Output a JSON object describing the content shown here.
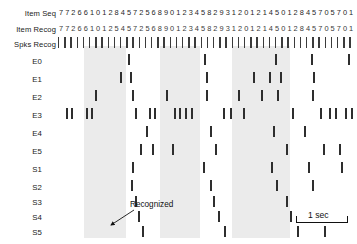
{
  "figure": {
    "title": "",
    "width": 357,
    "height": 244,
    "background_color": "#ffffff",
    "band_color": "#e8e8e8",
    "spike_color": "#2e2e2e"
  },
  "labels": {
    "item_seq": "Item Seq",
    "item_recog": "Item Recog",
    "spks_recog": "Spks Recog",
    "e0": "E0",
    "e1": "E1",
    "e2": "E2",
    "e3": "E3",
    "e4": "E4",
    "e5": "E5",
    "s1": "S1",
    "s2": "S2",
    "s3": "S3",
    "s4": "S4",
    "s5": "S5"
  },
  "annotation": {
    "recognized": "Recognized"
  },
  "scalebar": {
    "label": "1 sec"
  },
  "chart_data": {
    "type": "raster",
    "title": "",
    "xlabel": "",
    "ylabel": "",
    "xlim": [
      0,
      296
    ],
    "grid": false,
    "legend": null,
    "sequences": {
      "item_seq": "77266101284572568901234582931201214501284570 5701",
      "item_seq_digits": [
        "7",
        "7",
        "2",
        "6",
        "6",
        "1",
        "0",
        "1",
        "2",
        "8",
        "4",
        "5",
        "7",
        "2",
        "5",
        "6",
        "8",
        "9",
        "0",
        "1",
        "2",
        "3",
        "4",
        "5",
        "8",
        "2",
        "9",
        "3",
        "1",
        "2",
        "0",
        "1",
        "2",
        "1",
        "4",
        "5",
        "0",
        "1",
        "2",
        "8",
        "4",
        "5",
        "7",
        "0",
        "5",
        "7",
        "0",
        "1"
      ],
      "item_recog_digits": [
        "7",
        "7",
        "2",
        "6",
        "6",
        "1",
        "0",
        "1",
        "2",
        "5",
        "4",
        "5",
        "7",
        "2",
        "5",
        "6",
        "8",
        "9",
        "0",
        "1",
        "2",
        "3",
        "4",
        "5",
        "8",
        "2",
        "9",
        "3",
        "1",
        "2",
        "0",
        "1",
        "2",
        "1",
        "4",
        "5",
        "0",
        "1",
        "2",
        "8",
        "4",
        "5",
        "7",
        "0",
        "5",
        "7",
        "0",
        "1"
      ]
    },
    "bands": [
      {
        "x": 84,
        "width": 42
      },
      {
        "x": 160,
        "width": 40
      },
      {
        "x": 232,
        "width": 58
      }
    ],
    "rows": [
      {
        "name": "Spks Recog",
        "type": "ticks",
        "times": [
          0,
          6.2,
          12.4,
          18.6,
          24.8,
          31,
          37.2,
          43.4,
          49.6,
          55.8,
          62,
          68.2,
          74.4,
          80.6,
          86.8,
          93,
          99.2,
          105.4,
          111.6,
          117.8,
          124,
          130.2,
          136.4,
          142.6,
          148.8,
          155,
          161.2,
          167.4,
          173.6,
          179.8,
          186,
          192.2,
          198.4,
          204.6,
          210.8,
          217,
          223.2,
          229.4,
          235.6,
          241.8,
          248,
          254.2,
          260.4,
          266.6,
          272.8,
          279,
          285.2,
          291.4
        ]
      },
      {
        "name": "E0",
        "type": "spikes",
        "times": [
          70,
          146,
          217,
          253,
          290
        ]
      },
      {
        "name": "E1",
        "type": "spikes",
        "times": [
          62,
          72,
          148,
          195,
          211,
          222,
          255,
          304
        ]
      },
      {
        "name": "E2",
        "type": "spikes",
        "times": [
          37,
          74,
          108,
          148,
          180,
          203,
          219,
          254
        ]
      },
      {
        "name": "E3",
        "type": "spikes",
        "times": [
          8,
          13,
          28,
          33,
          77,
          91,
          96,
          116,
          121,
          127,
          133,
          165,
          172,
          185,
          234,
          262,
          271,
          277,
          287,
          293
        ]
      },
      {
        "name": "E4",
        "type": "spikes",
        "times": [
          88,
          152,
          215,
          246
        ]
      },
      {
        "name": "E5",
        "type": "spikes",
        "times": [
          82,
          94,
          114,
          157,
          228,
          265,
          281
        ]
      },
      {
        "name": "S1",
        "type": "spikes",
        "times": [
          74,
          145,
          213,
          250,
          283
        ]
      },
      {
        "name": "S2",
        "type": "spikes",
        "times": [
          73,
          152,
          218,
          254
        ]
      },
      {
        "name": "S3",
        "type": "spikes",
        "times": [
          77,
          155,
          228
        ]
      },
      {
        "name": "S4",
        "type": "spikes",
        "times": [
          80,
          160,
          232
        ]
      },
      {
        "name": "S5",
        "type": "spikes",
        "times": [
          84,
          166,
          239,
          266
        ]
      }
    ]
  }
}
